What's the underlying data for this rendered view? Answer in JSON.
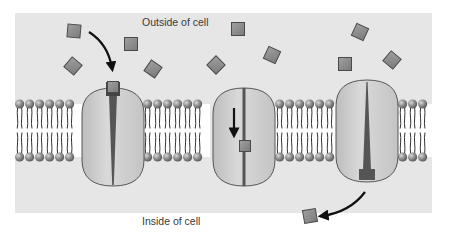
{
  "diagram": {
    "type": "membrane-transport-carrier-protein",
    "labels": {
      "outside": "Outside of cell",
      "inside": "Inside of cell"
    },
    "colors": {
      "page_background": "#ffffff",
      "panel_background": "#e6e6e6",
      "molecule_fill": "#8c8c8c",
      "molecule_stroke": "#4a4a4a",
      "protein_fill": "#cfcfcf",
      "protein_stroke": "#555555",
      "channel_fill": "#555555",
      "lipid_head": "#8a8a8a",
      "lipid_tail": "#333333",
      "arrow": "#111111",
      "text": "#3a3a3a"
    },
    "panel": {
      "x": 15,
      "y": 13,
      "width": 417,
      "height": 200
    },
    "membrane": {
      "top_heads_y": 104,
      "bottom_heads_y": 157,
      "segments": [
        {
          "x_start": 15,
          "x_end": 82
        },
        {
          "x_start": 143,
          "x_end": 210
        },
        {
          "x_start": 275,
          "x_end": 336
        },
        {
          "x_start": 398,
          "x_end": 432
        }
      ]
    },
    "proteins": [
      {
        "name": "carrier-protein-open-outside",
        "cx": 113,
        "top": 88,
        "bottom": 186,
        "width": 62,
        "state": "binding"
      },
      {
        "name": "carrier-protein-transit",
        "cx": 244,
        "top": 88,
        "bottom": 186,
        "width": 62,
        "state": "translocating"
      },
      {
        "name": "carrier-protein-open-inside",
        "cx": 367,
        "top": 80,
        "bottom": 182,
        "width": 62,
        "state": "releasing"
      }
    ],
    "molecules_outside": [
      {
        "x": 74,
        "y": 31,
        "rot": 5
      },
      {
        "x": 131,
        "y": 44,
        "rot": 0
      },
      {
        "x": 73,
        "y": 66,
        "rot": 40
      },
      {
        "x": 153,
        "y": 69,
        "rot": 35
      },
      {
        "x": 238,
        "y": 29,
        "rot": 0
      },
      {
        "x": 272,
        "y": 55,
        "rot": 25
      },
      {
        "x": 360,
        "y": 32,
        "rot": 25
      },
      {
        "x": 345,
        "y": 64,
        "rot": 0
      },
      {
        "x": 392,
        "y": 60,
        "rot": 40
      },
      {
        "x": 216,
        "y": 65,
        "rot": 45
      }
    ],
    "molecules_bound": [
      {
        "x": 113,
        "y": 87,
        "rot": 0
      },
      {
        "x": 245,
        "y": 146,
        "rot": 0
      }
    ],
    "molecules_inside": [
      {
        "x": 310,
        "y": 216,
        "rot": -10
      }
    ],
    "arrows": [
      {
        "name": "arrow-binding",
        "path": "M 89 32 Q 108 44 112 68"
      },
      {
        "name": "arrow-translocation",
        "path": "M 234 108 L 234 134"
      },
      {
        "name": "arrow-release",
        "path": "M 365 192 Q 350 212 322 216"
      }
    ]
  }
}
